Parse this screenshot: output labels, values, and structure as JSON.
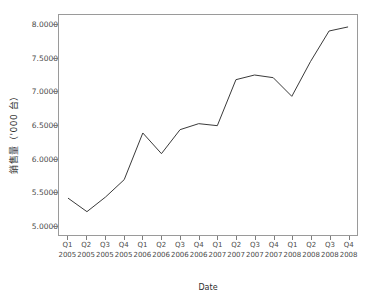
{
  "chart_data": {
    "type": "line",
    "title": "",
    "subtitle": "",
    "xlabel": "Date",
    "ylabel": "銷售量（'000 台）",
    "ylabel_main": "銷售量",
    "ylabel_unit": "（'000 台）",
    "categories": [
      "Q1 2005",
      "Q2 2005",
      "Q3 2005",
      "Q4 2005",
      "Q1 2006",
      "Q2 2006",
      "Q3 2006",
      "Q4 2006",
      "Q1 2007",
      "Q2 2007",
      "Q3 2007",
      "Q4 2007",
      "Q1 2008",
      "Q2 2008",
      "Q3 2008",
      "Q4 2008"
    ],
    "quarters": [
      "Q1",
      "Q2",
      "Q3",
      "Q4",
      "Q1",
      "Q2",
      "Q3",
      "Q4",
      "Q1",
      "Q2",
      "Q3",
      "Q4",
      "Q1",
      "Q2",
      "Q3",
      "Q4"
    ],
    "years": [
      "2005",
      "2005",
      "2005",
      "2005",
      "2006",
      "2006",
      "2006",
      "2006",
      "2007",
      "2007",
      "2007",
      "2007",
      "2008",
      "2008",
      "2008",
      "2008"
    ],
    "values": [
      5.4,
      5.2,
      5.42,
      5.68,
      6.38,
      6.07,
      6.43,
      6.52,
      6.49,
      7.18,
      7.25,
      7.21,
      6.93,
      7.45,
      7.91,
      7.97
    ],
    "ylim": [
      4.85,
      8.15
    ],
    "yticks": [
      5.0,
      5.5,
      6.0,
      6.5,
      7.0,
      7.5,
      8.0
    ],
    "ytick_labels": [
      "5.0000",
      "5.5000",
      "6.0000",
      "6.5000",
      "7.0000",
      "7.5000",
      "8.0000"
    ],
    "grid": false,
    "legend": "none",
    "line_color": "#3a3a3a",
    "axis_color": "#9a9a9a",
    "background": "#ffffff"
  }
}
